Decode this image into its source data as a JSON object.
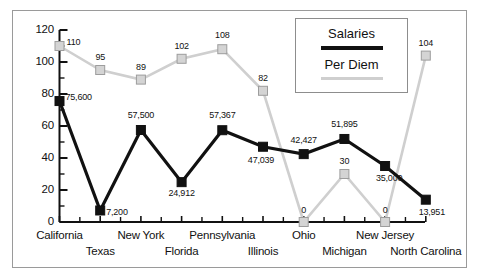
{
  "chart_data": {
    "type": "line",
    "title": "",
    "xlabel": "",
    "ylabel": "",
    "ylim": [
      0,
      120
    ],
    "ytick_labels": [
      "120",
      "100",
      "80",
      "60",
      "40",
      "20",
      "0"
    ],
    "ytick_values": [
      120,
      100,
      80,
      60,
      40,
      20,
      0
    ],
    "minor_tick_step": 10,
    "grid": false,
    "legend_position": "top-right",
    "categories": [
      "California",
      "Texas",
      "New York",
      "Florida",
      "Pennsylvania",
      "Illinois",
      "Ohio",
      "Michigan",
      "New Jersey",
      "North Carolina"
    ],
    "series": [
      {
        "name": "Salaries",
        "color": "#111111",
        "marker": "square-filled",
        "values": [
          75600,
          7200,
          57500,
          24912,
          57367,
          47039,
          42427,
          51895,
          35000,
          13951
        ],
        "point_labels": [
          "75,600",
          "7,200",
          "57,500",
          "24,912",
          "57,367",
          "47,039",
          "42,427",
          "51,895",
          "35,000",
          "13,951"
        ],
        "plot_values": [
          75.6,
          7.2,
          57.5,
          24.912,
          57.367,
          47.039,
          42.427,
          51.895,
          35.0,
          13.951
        ]
      },
      {
        "name": "Per Diem",
        "color": "#cfcfcf",
        "marker": "square-open",
        "values": [
          110,
          95,
          89,
          102,
          108,
          82,
          0,
          30,
          0,
          104
        ],
        "point_labels": [
          "110",
          "95",
          "89",
          "102",
          "108",
          "82",
          "0",
          "30",
          "0",
          "104"
        ],
        "plot_values": [
          110,
          95,
          89,
          102,
          108,
          82,
          0,
          30,
          0,
          104
        ]
      }
    ]
  },
  "legend": {
    "salaries_label": "Salaries",
    "per_diem_label": "Per Diem"
  },
  "colors": {
    "salaries": "#111111",
    "per_diem": "#cfcfcf",
    "axis": "#111111",
    "frame": "#9a9a9a"
  }
}
